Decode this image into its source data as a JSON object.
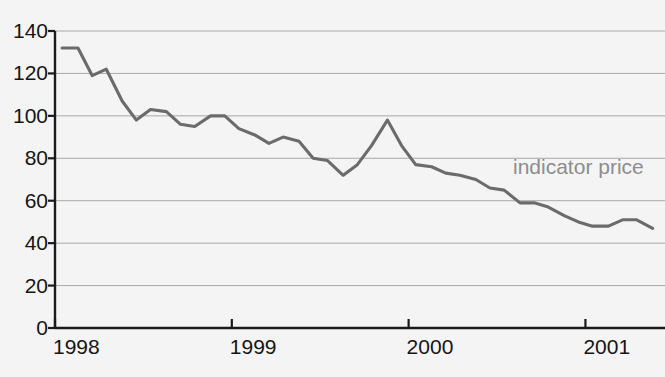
{
  "chart_data": {
    "type": "line",
    "title": "",
    "xlabel": "",
    "ylabel": "",
    "ylim": [
      0,
      140
    ],
    "xlim": [
      1998.0,
      2001.45
    ],
    "grid": true,
    "legend_position": "inline-right",
    "y_ticks": [
      0,
      20,
      40,
      60,
      80,
      100,
      120,
      140
    ],
    "x_ticks": [
      1998,
      1999,
      2000,
      2001
    ],
    "x_tick_labels": [
      "1998",
      "1999",
      "2000",
      "2001"
    ],
    "annotations": [
      {
        "text": "indicator price",
        "x": 2001.05,
        "y": 74,
        "color": "#8d8d8d"
      }
    ],
    "series": [
      {
        "name": "indicator price",
        "color": "#6b6b6b",
        "x": [
          1998.04,
          1998.13,
          1998.21,
          1998.29,
          1998.38,
          1998.46,
          1998.54,
          1998.63,
          1998.71,
          1998.79,
          1998.88,
          1998.96,
          1999.04,
          1999.13,
          1999.21,
          1999.29,
          1999.38,
          1999.46,
          1999.54,
          1999.63,
          1999.71,
          1999.79,
          1999.88,
          1999.96,
          2000.04,
          2000.13,
          2000.21,
          2000.29,
          2000.38,
          2000.46,
          2000.54,
          2000.63,
          2000.71,
          2000.79,
          2000.88,
          2000.96,
          2001.04,
          2001.13,
          2001.21,
          2001.29,
          2001.38
        ],
        "values": [
          132,
          132,
          119,
          122,
          107,
          98,
          103,
          102,
          96,
          95,
          100,
          100,
          94,
          91,
          87,
          90,
          88,
          80,
          79,
          72,
          77,
          86,
          98,
          86,
          77,
          76,
          73,
          72,
          70,
          66,
          65,
          59,
          59,
          57,
          53,
          50,
          48,
          48,
          51,
          51,
          47
        ]
      }
    ]
  },
  "axes": {
    "y_labels": [
      "140",
      "120",
      "100",
      "80",
      "60",
      "40",
      "20",
      "0"
    ],
    "x_labels": [
      "1998",
      "1999",
      "2000",
      "2001"
    ]
  },
  "annotation": {
    "label": "indicator price"
  },
  "colors": {
    "line": "#6b6b6b",
    "grid": "#a8a8a8",
    "axis": "#1a1a1a",
    "background": "#f4f4f4",
    "annotation_text": "#8d8d8d",
    "tick_text": "#151515"
  }
}
